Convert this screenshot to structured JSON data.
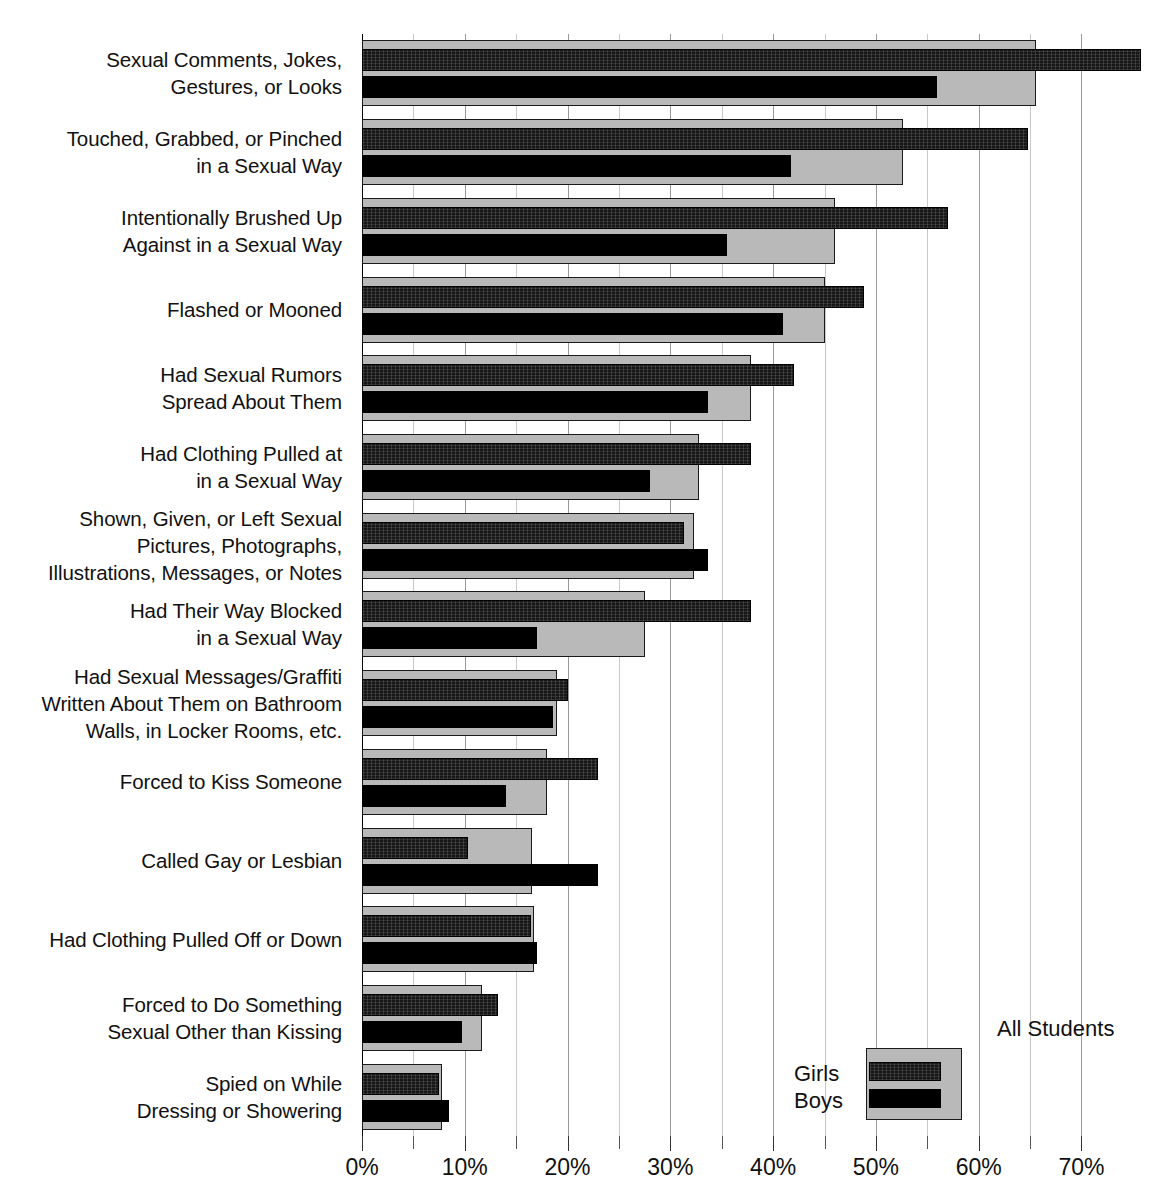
{
  "chart_data": {
    "type": "bar",
    "orientation": "horizontal",
    "title": "",
    "subtitle": "",
    "xlabel": "",
    "ylabel": "",
    "xlim": [
      0,
      72
    ],
    "xticks": [
      0,
      10,
      20,
      30,
      40,
      50,
      60,
      70
    ],
    "xtick_labels": [
      "0%",
      "10%",
      "20%",
      "30%",
      "40%",
      "50%",
      "60%",
      "70%"
    ],
    "minor_tick_step": 5,
    "grid": true,
    "grid_axis": "x",
    "legend_position": "bottom-right",
    "value_unit": "%",
    "categories": [
      "Sexual Comments, Jokes,\nGestures, or Looks",
      "Touched, Grabbed, or Pinched\nin a Sexual Way",
      "Intentionally Brushed Up\nAgainst in a Sexual Way",
      "Flashed or Mooned",
      "Had Sexual Rumors\nSpread About Them",
      "Had Clothing Pulled at\nin a Sexual Way",
      "Shown, Given, or Left Sexual\nPictures, Photographs,\nIllustrations, Messages, or Notes",
      "Had Their Way Blocked\nin a Sexual Way",
      "Had Sexual Messages/Graffiti\nWritten About Them on Bathroom\nWalls, in Locker Rooms, etc.",
      "Forced to Kiss Someone",
      "Called Gay or Lesbian",
      "Had Clothing Pulled Off or Down",
      "Forced to Do Something\nSexual Other than Kissing",
      "Spied on While\nDressing or Showering"
    ],
    "series": [
      {
        "name": "All Students",
        "color": "#b9b9b9",
        "values": [
          65.6,
          52.6,
          46.0,
          45.0,
          37.8,
          32.8,
          32.3,
          27.5,
          19.0,
          18.0,
          16.5,
          16.7,
          11.7,
          7.8
        ]
      },
      {
        "name": "Girls",
        "color": "#171717",
        "values": [
          75.8,
          64.8,
          57.0,
          48.8,
          42.0,
          37.8,
          31.3,
          37.8,
          20.0,
          23.0,
          10.3,
          16.4,
          13.2,
          7.5
        ]
      },
      {
        "name": "Boys",
        "color": "#000000",
        "values": [
          55.9,
          41.7,
          35.5,
          41.0,
          33.7,
          28.0,
          33.7,
          17.0,
          18.6,
          14.0,
          23.0,
          17.0,
          9.7,
          8.5
        ]
      }
    ]
  },
  "legend": {
    "all_students_label": "All Students",
    "girls_label": "Girls",
    "boys_label": "Boys"
  }
}
